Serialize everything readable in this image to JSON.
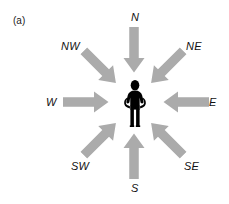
{
  "figure": {
    "panel_label": "(a)",
    "arrow_color": "#ababab",
    "figure_color": "#000000",
    "label_color": "#111111",
    "background_color": "#ffffff",
    "center_icon": "standing-person-icon",
    "directions": [
      {
        "id": "n",
        "label": "N",
        "heading_deg": 0,
        "arrow_points_deg": 180,
        "label_x": 131,
        "label_y": 11,
        "arrow_cx": 134,
        "arrow_cy": 50
      },
      {
        "id": "ne",
        "label": "NE",
        "heading_deg": 45,
        "arrow_points_deg": 225,
        "label_x": 186,
        "label_y": 40,
        "arrow_cx": 167,
        "arrow_cy": 67
      },
      {
        "id": "e",
        "label": "E",
        "heading_deg": 90,
        "arrow_points_deg": 270,
        "label_x": 209,
        "label_y": 96,
        "arrow_cx": 186,
        "arrow_cy": 102
      },
      {
        "id": "se",
        "label": "SE",
        "heading_deg": 135,
        "arrow_points_deg": 315,
        "label_x": 184,
        "label_y": 160,
        "arrow_cx": 167,
        "arrow_cy": 139
      },
      {
        "id": "s",
        "label": "S",
        "heading_deg": 180,
        "arrow_points_deg": 0,
        "label_x": 131,
        "label_y": 182,
        "arrow_cx": 134,
        "arrow_cy": 156
      },
      {
        "id": "sw",
        "label": "SW",
        "heading_deg": 225,
        "arrow_points_deg": 45,
        "label_x": 71,
        "label_y": 160,
        "arrow_cx": 100,
        "arrow_cy": 139
      },
      {
        "id": "w",
        "label": "W",
        "heading_deg": 270,
        "arrow_points_deg": 90,
        "label_x": 46,
        "label_y": 96,
        "arrow_cx": 86,
        "arrow_cy": 102
      },
      {
        "id": "nw",
        "label": "NW",
        "heading_deg": 315,
        "arrow_points_deg": 135,
        "label_x": 61,
        "label_y": 40,
        "arrow_cx": 100,
        "arrow_cy": 67
      }
    ]
  },
  "chart_data": {
    "type": "diagram",
    "title": "(a)",
    "categories": [
      "N",
      "NE",
      "E",
      "SE",
      "S",
      "SW",
      "W",
      "NW"
    ],
    "values": [
      0,
      45,
      90,
      135,
      180,
      225,
      270,
      315
    ],
    "xlabel": "",
    "ylabel": "",
    "legend": [],
    "annotations": [
      "(a)"
    ]
  }
}
